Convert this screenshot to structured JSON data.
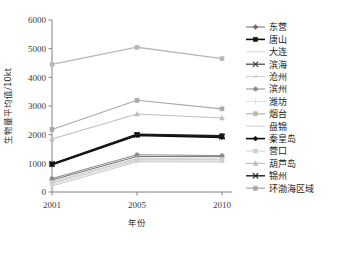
{
  "chart_data": {
    "type": "line",
    "title": "",
    "xlabel": "年份",
    "ylabel": "生物量平均值/10kt",
    "x": [
      "2001",
      "2005",
      "2010"
    ],
    "categories": [
      "2001",
      "2005",
      "2010"
    ],
    "ylim": [
      0,
      6000
    ],
    "yticks": [
      "0",
      "1000",
      "2000",
      "3000",
      "4000",
      "5000",
      "6000"
    ],
    "ytick_values": [
      0,
      1000,
      2000,
      3000,
      4000,
      5000,
      6000
    ],
    "grid": false,
    "legend_position": "right",
    "series": [
      {
        "name": "东营",
        "values": [
          420,
          1240,
          1230
        ],
        "color": "#6e6e6e",
        "marker": "diamond",
        "width": 1.0
      },
      {
        "name": "唐山",
        "values": [
          980,
          2010,
          1960
        ],
        "color": "#111111",
        "marker": "square",
        "width": 1.6
      },
      {
        "name": "大连",
        "values": [
          300,
          1090,
          1080
        ],
        "color": "#d8d8d8",
        "marker": "none",
        "width": 1.0
      },
      {
        "name": "滨海",
        "values": [
          965,
          1990,
          1930
        ],
        "color": "#3b3b3b",
        "marker": "cross",
        "width": 1.2
      },
      {
        "name": "沧州",
        "values": [
          210,
          1055,
          1045
        ],
        "color": "#c9c9c9",
        "marker": "star",
        "width": 1.0
      },
      {
        "name": "滨州",
        "values": [
          470,
          1300,
          1270
        ],
        "color": "#8a8a8a",
        "marker": "circle",
        "width": 1.0
      },
      {
        "name": "潍坊",
        "values": [
          250,
          1130,
          1110
        ],
        "color": "#e0e0e0",
        "marker": "plus",
        "width": 1.0
      },
      {
        "name": "烟台",
        "values": [
          4450,
          5050,
          4650
        ],
        "color": "#b8b8b8",
        "marker": "square",
        "width": 1.3
      },
      {
        "name": "盘锦",
        "values": [
          360,
          1180,
          1150
        ],
        "color": "#d2d2d2",
        "marker": "none",
        "width": 1.0
      },
      {
        "name": "秦皇岛",
        "values": [
          955,
          1975,
          1905
        ],
        "color": "#0b0b0b",
        "marker": "diamond",
        "width": 1.6
      },
      {
        "name": "营口",
        "values": [
          330,
          1150,
          1130
        ],
        "color": "#cfcfcf",
        "marker": "square",
        "width": 1.0
      },
      {
        "name": "葫芦岛",
        "values": [
          1850,
          2720,
          2580
        ],
        "color": "#bdbdbd",
        "marker": "triangle",
        "width": 1.1
      },
      {
        "name": "锦州",
        "values": [
          975,
          2000,
          1940
        ],
        "color": "#1a1a1a",
        "marker": "cross",
        "width": 1.4
      },
      {
        "name": "环渤海区域",
        "values": [
          2180,
          3200,
          2900
        ],
        "color": "#a8a8a8",
        "marker": "square",
        "width": 1.2
      }
    ]
  },
  "legend": {
    "items": [
      {
        "label": "东营"
      },
      {
        "label": "唐山"
      },
      {
        "label": "大连"
      },
      {
        "label": "滨海"
      },
      {
        "label": "沧州"
      },
      {
        "label": "滨州"
      },
      {
        "label": "潍坊"
      },
      {
        "label": "烟台"
      },
      {
        "label": "盘锦"
      },
      {
        "label": "秦皇岛"
      },
      {
        "label": "营口"
      },
      {
        "label": "葫芦岛"
      },
      {
        "label": "锦州"
      },
      {
        "label": "环渤海区域"
      }
    ]
  }
}
